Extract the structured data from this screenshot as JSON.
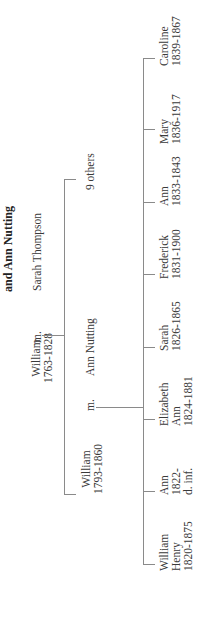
{
  "title": "and Ann Nutting",
  "generation1": {
    "person": {
      "name": "William",
      "dates": "1763-1828"
    },
    "marriage_label": "m.",
    "spouse": "Sarah Thompson"
  },
  "generation2": {
    "person": {
      "name": "William",
      "dates": "1793-1860"
    },
    "marriage_label": "m.",
    "spouse": "Ann Nutting",
    "siblings_note": "9 others"
  },
  "children": [
    {
      "line1": "William",
      "line2": "Henry",
      "line3": "1820-1875"
    },
    {
      "line1": "Ann",
      "line2": "1822-",
      "line3": "d. inf."
    },
    {
      "line1": "Elizabeth",
      "line2": "Ann",
      "line3": "1824-1881"
    },
    {
      "line1": "Sarah",
      "line2": "1826-1865",
      "line3": ""
    },
    {
      "line1": "Frederick",
      "line2": "1831-1900",
      "line3": ""
    },
    {
      "line1": "Ann",
      "line2": "1833-1843",
      "line3": ""
    },
    {
      "line1": "Mary",
      "line2": "1836-1917",
      "line3": ""
    },
    {
      "line1": "Caroline",
      "line2": "1839-1867",
      "line3": ""
    }
  ],
  "colors": {
    "text": "#3a3a3a",
    "lines": "#8a8a8a",
    "background": "#ffffff"
  }
}
